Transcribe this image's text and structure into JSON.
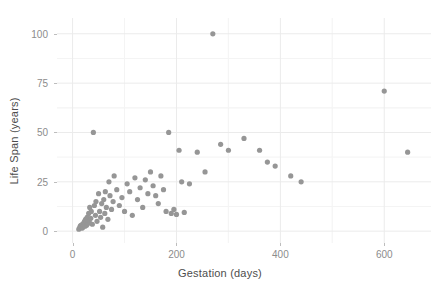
{
  "chart_data": {
    "type": "scatter",
    "title": "",
    "xlabel": "Gestation (days)",
    "ylabel": "Life Span (years)",
    "xlim": [
      -30,
      690
    ],
    "ylim": [
      -6,
      108
    ],
    "xticks": [
      0,
      200,
      400,
      600
    ],
    "yticks": [
      0,
      25,
      50,
      75,
      100
    ],
    "xtick_labels": [
      "0",
      "200",
      "400",
      "600"
    ],
    "ytick_labels": [
      "0",
      "25",
      "50",
      "75",
      "100"
    ],
    "grid": true,
    "grid_minor": true,
    "legend": "none",
    "point_color": "#969696",
    "point_radius": 2.6,
    "points": [
      [
        12,
        1.0
      ],
      [
        14,
        2.0
      ],
      [
        15,
        2.5
      ],
      [
        16,
        3.0
      ],
      [
        17,
        2.0
      ],
      [
        18,
        1.5
      ],
      [
        19,
        3.5
      ],
      [
        20,
        2.0
      ],
      [
        21,
        4.0
      ],
      [
        22,
        3.0
      ],
      [
        23,
        5.0
      ],
      [
        24,
        2.5
      ],
      [
        25,
        6.0
      ],
      [
        26,
        4.5
      ],
      [
        27,
        3.0
      ],
      [
        28,
        7.0
      ],
      [
        30,
        4.0
      ],
      [
        31,
        9.0
      ],
      [
        32,
        5.0
      ],
      [
        33,
        12.0
      ],
      [
        35,
        6.5
      ],
      [
        36,
        10.0
      ],
      [
        38,
        3.5
      ],
      [
        40,
        50.0
      ],
      [
        42,
        13.0
      ],
      [
        44,
        8.0
      ],
      [
        45,
        15.0
      ],
      [
        47,
        5.0
      ],
      [
        50,
        19.0
      ],
      [
        52,
        10.0
      ],
      [
        54,
        7.0
      ],
      [
        56,
        14.0
      ],
      [
        58,
        2.0
      ],
      [
        60,
        16.0
      ],
      [
        62,
        9.0
      ],
      [
        63,
        20.0
      ],
      [
        65,
        12.0
      ],
      [
        68,
        6.0
      ],
      [
        70,
        25.0
      ],
      [
        72,
        18.0
      ],
      [
        75,
        11.0
      ],
      [
        78,
        15.0
      ],
      [
        80,
        28.0
      ],
      [
        85,
        21.0
      ],
      [
        90,
        13.0
      ],
      [
        95,
        17.0
      ],
      [
        100,
        10.0
      ],
      [
        105,
        24.0
      ],
      [
        110,
        20.0
      ],
      [
        115,
        8.0
      ],
      [
        120,
        27.0
      ],
      [
        125,
        16.0
      ],
      [
        130,
        22.0
      ],
      [
        135,
        12.0
      ],
      [
        140,
        26.0
      ],
      [
        145,
        19.0
      ],
      [
        150,
        30.0
      ],
      [
        155,
        23.0
      ],
      [
        160,
        18.0
      ],
      [
        165,
        14.0
      ],
      [
        170,
        28.0
      ],
      [
        175,
        21.0
      ],
      [
        180,
        10.0
      ],
      [
        185,
        50.0
      ],
      [
        190,
        9.0
      ],
      [
        195,
        11.0
      ],
      [
        200,
        8.5
      ],
      [
        205,
        41.0
      ],
      [
        210,
        25.0
      ],
      [
        215,
        9.5
      ],
      [
        225,
        24.0
      ],
      [
        240,
        40.0
      ],
      [
        255,
        30.0
      ],
      [
        270,
        100.0
      ],
      [
        285,
        44.0
      ],
      [
        300,
        41.0
      ],
      [
        330,
        47.0
      ],
      [
        360,
        41.0
      ],
      [
        375,
        35.0
      ],
      [
        390,
        33.0
      ],
      [
        420,
        28.0
      ],
      [
        440,
        25.0
      ],
      [
        600,
        71.0
      ],
      [
        645,
        40.0
      ]
    ]
  }
}
